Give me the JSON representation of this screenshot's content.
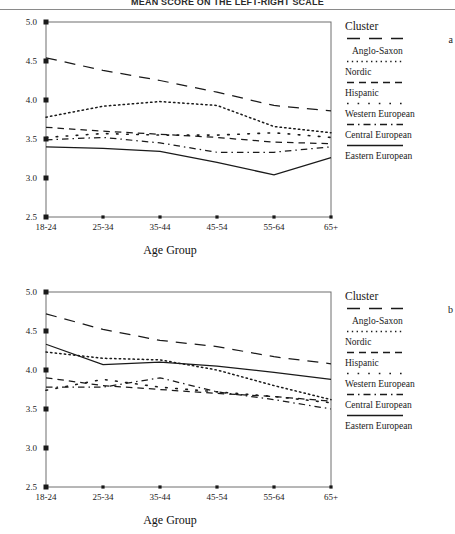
{
  "figure": {
    "title": "MEAN SCORE ON THE LEFT-RIGHT SCALE",
    "axis_x_label": "Age Group",
    "legend_title": "Cluster"
  },
  "chart_data": [
    {
      "type": "line",
      "panel": "a",
      "title": "MEAN SCORE ON THE LEFT-RIGHT SCALE",
      "xlabel": "Age Group",
      "ylabel": "",
      "categories": [
        "18-24",
        "25-34",
        "35-44",
        "45-54",
        "55-64",
        "65+"
      ],
      "ylim": [
        2.5,
        5.0
      ],
      "yticks": [
        "2.5",
        "3.0",
        "3.5",
        "4.0",
        "4.5",
        "5.0"
      ],
      "grid": false,
      "legend_position": "right",
      "series": [
        {
          "name": "Anglo-Saxon",
          "style": "long-dash",
          "values": [
            4.54,
            4.38,
            4.25,
            4.1,
            3.93,
            3.86
          ]
        },
        {
          "name": "Nordic",
          "style": "dotted",
          "values": [
            3.78,
            3.92,
            3.98,
            3.93,
            3.66,
            3.58
          ]
        },
        {
          "name": "Hispanic",
          "style": "dash",
          "values": [
            3.65,
            3.6,
            3.56,
            3.52,
            3.46,
            3.44
          ]
        },
        {
          "name": "Western European",
          "style": "dot-wide",
          "values": [
            3.52,
            3.57,
            3.55,
            3.55,
            3.58,
            3.52
          ]
        },
        {
          "name": "Central European",
          "style": "dash-dot",
          "values": [
            3.49,
            3.52,
            3.45,
            3.33,
            3.33,
            3.4
          ]
        },
        {
          "name": "Eastern European",
          "style": "solid",
          "values": [
            3.4,
            3.38,
            3.34,
            3.2,
            3.04,
            3.26
          ]
        }
      ]
    },
    {
      "type": "line",
      "panel": "b",
      "title": "MEAN SCORE ON THE LEFT-RIGHT SCALE",
      "xlabel": "Age Group",
      "ylabel": "",
      "categories": [
        "18-24",
        "25-34",
        "35-44",
        "45-54",
        "55-64",
        "65+"
      ],
      "ylim": [
        2.5,
        5.0
      ],
      "yticks": [
        "2.5",
        "3.0",
        "3.5",
        "4.0",
        "4.5",
        "5.0"
      ],
      "grid": false,
      "legend_position": "right",
      "series": [
        {
          "name": "Anglo-Saxon",
          "style": "long-dash",
          "values": [
            4.72,
            4.52,
            4.38,
            4.3,
            4.17,
            4.08
          ]
        },
        {
          "name": "Nordic",
          "style": "dotted",
          "values": [
            4.23,
            4.15,
            4.13,
            4.0,
            3.8,
            3.62
          ]
        },
        {
          "name": "Hispanic",
          "style": "dash",
          "values": [
            3.9,
            3.8,
            3.75,
            3.7,
            3.66,
            3.6
          ]
        },
        {
          "name": "Western European",
          "style": "dot-wide",
          "values": [
            3.74,
            3.88,
            3.78,
            3.72,
            3.66,
            3.58
          ]
        },
        {
          "name": "Central European",
          "style": "dash-dot",
          "values": [
            3.78,
            3.78,
            3.9,
            3.72,
            3.62,
            3.5
          ]
        },
        {
          "name": "Eastern European",
          "style": "solid",
          "values": [
            4.33,
            4.07,
            4.1,
            4.05,
            3.97,
            3.88
          ]
        }
      ]
    }
  ],
  "panels": [
    {
      "letter": "a",
      "legend_title": "Cluster",
      "axis_x_label": "Age Group",
      "entries": [
        {
          "label": "Anglo-Saxon"
        },
        {
          "label": "Nordic"
        },
        {
          "label": "Hispanic"
        },
        {
          "label": "Western European"
        },
        {
          "label": "Central European"
        },
        {
          "label": "Eastern European"
        }
      ]
    },
    {
      "letter": "b",
      "legend_title": "Cluster",
      "axis_x_label": "Age Group",
      "entries": [
        {
          "label": "Anglo-Saxon"
        },
        {
          "label": "Nordic"
        },
        {
          "label": "Hispanic"
        },
        {
          "label": "Western European"
        },
        {
          "label": "Central European"
        },
        {
          "label": "Eastern European"
        }
      ]
    }
  ]
}
